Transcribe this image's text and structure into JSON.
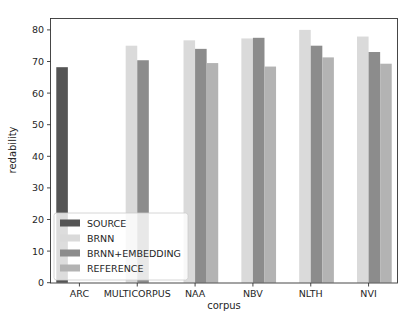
{
  "chart_data": {
    "type": "bar",
    "title": "",
    "xlabel": "corpus",
    "ylabel": "redability",
    "ylim": [
      0,
      84
    ],
    "yticks": [
      0,
      10,
      20,
      30,
      40,
      50,
      60,
      70,
      80
    ],
    "grid": false,
    "legend_position": "lower left",
    "categories": [
      "ARC",
      "MULTICORPUS",
      "NAA",
      "NBV",
      "NLTH",
      "NVI"
    ],
    "series": [
      {
        "name": "SOURCE",
        "color": "#555555",
        "values": [
          68.2,
          null,
          null,
          null,
          null,
          null
        ]
      },
      {
        "name": "BRNN",
        "color": "#dadada",
        "values": [
          null,
          75.0,
          76.7,
          77.3,
          80.0,
          77.9
        ]
      },
      {
        "name": "BRNN+EMBEDDING",
        "color": "#8c8c8c",
        "values": [
          null,
          70.4,
          74.0,
          77.5,
          75.0,
          73.0
        ]
      },
      {
        "name": "REFERENCE",
        "color": "#b3b3b3",
        "values": [
          null,
          null,
          69.5,
          68.4,
          71.3,
          69.3
        ]
      }
    ]
  }
}
